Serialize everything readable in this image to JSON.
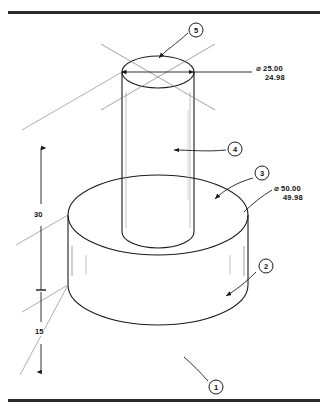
{
  "drawing": {
    "title": "Isometric stepped cylindrical part",
    "type": "isometric-technical-drawing",
    "frame": {
      "top_rule": true,
      "bottom_rule": true,
      "border_color": "#2a2a2a"
    },
    "dimensions": [
      {
        "id": "dia-top",
        "symbol": "⌀",
        "upper": "25.00",
        "lower": "24.98",
        "applies_to": "upper shaft diameter",
        "position": "right-top"
      },
      {
        "id": "dia-base",
        "symbol": "⌀",
        "upper": "50.00",
        "lower": "49.98",
        "applies_to": "base disc diameter",
        "position": "right-middle"
      },
      {
        "id": "height-shaft",
        "value": "30",
        "applies_to": "shaft height above base",
        "position": "left-upper"
      },
      {
        "id": "height-base",
        "value": "15",
        "applies_to": "base disc thickness",
        "position": "left-lower"
      }
    ],
    "balloons": [
      {
        "id": "balloon-1",
        "label": "1",
        "points_to": "base bottom face"
      },
      {
        "id": "balloon-2",
        "label": "2",
        "points_to": "base cylindrical surface"
      },
      {
        "id": "balloon-3",
        "label": "3",
        "points_to": "base top face"
      },
      {
        "id": "balloon-4",
        "label": "4",
        "points_to": "shaft cylindrical surface"
      },
      {
        "id": "balloon-5",
        "label": "5",
        "points_to": "shaft top face"
      }
    ],
    "colors": {
      "line": "#1a1a1a",
      "thin_line": "#555555",
      "rule": "#2a2a2a",
      "background": "#ffffff"
    }
  }
}
